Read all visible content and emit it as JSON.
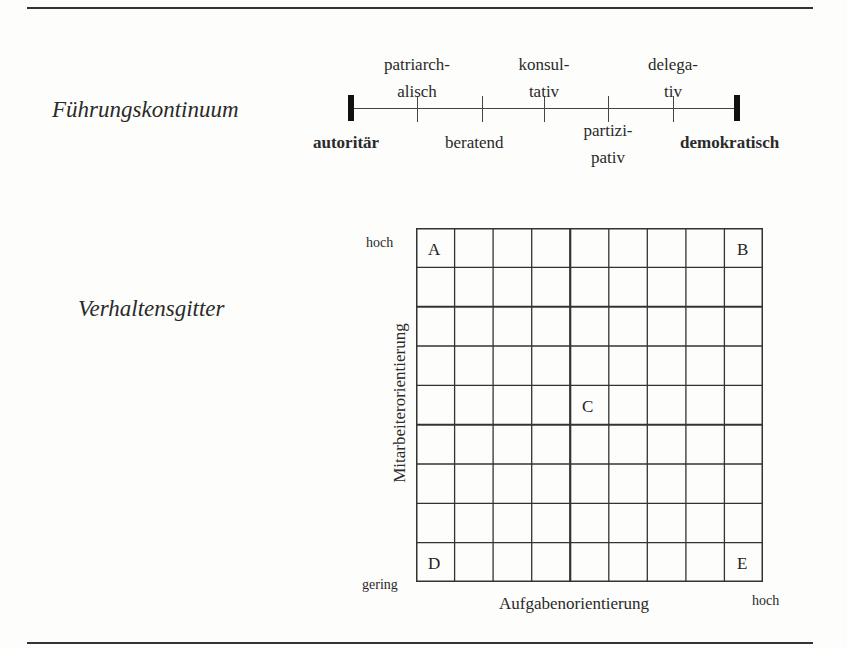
{
  "section_titles": {
    "continuum": "Führungskontinuum",
    "grid": "Verhaltensgitter"
  },
  "continuum": {
    "left_end": "autoritär",
    "right_end": "demokratisch",
    "styles_above": [
      {
        "line1": "patriarch-",
        "line2": "alisch"
      },
      {
        "line1": "konsul-",
        "line2": "tativ"
      },
      {
        "line1": "delega-",
        "line2": "tiv"
      }
    ],
    "styles_below": [
      {
        "line1": "beratend",
        "line2": ""
      },
      {
        "line1": "partizi-",
        "line2": "pativ"
      }
    ],
    "order": [
      "autoritär",
      "patriarchalisch",
      "beratend",
      "konsultativ",
      "partizipativ",
      "delegativ",
      "demokratisch"
    ]
  },
  "behavior_grid": {
    "rows": 9,
    "cols": 9,
    "y_axis_label": "Mitarbeiterorientierung",
    "x_axis_label": "Aufgabenorientierung",
    "y_high": "hoch",
    "y_low": "gering",
    "x_high": "hoch",
    "corners": {
      "top_left": "A",
      "top_right": "B",
      "center": "C",
      "bottom_left": "D",
      "bottom_right": "E"
    }
  }
}
